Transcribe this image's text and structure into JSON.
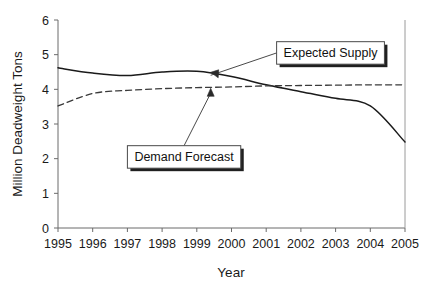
{
  "chart_data": {
    "type": "line",
    "title": "",
    "xlabel": "Year",
    "ylabel": "Million Deadweight Tons",
    "x": [
      1995,
      1996,
      1997,
      1998,
      1999,
      2000,
      2001,
      2002,
      2003,
      2004,
      2005
    ],
    "xtick_labels": [
      "1995",
      "1996",
      "1997",
      "1998",
      "1999",
      "2000",
      "2001",
      "2002",
      "2003",
      "2004",
      "2005"
    ],
    "ytick_labels": [
      "0",
      "1",
      "2",
      "3",
      "4",
      "5",
      "6"
    ],
    "ytick_values": [
      0,
      1,
      2,
      3,
      4,
      5,
      6
    ],
    "xlim": [
      1995,
      2005
    ],
    "ylim": [
      0,
      6
    ],
    "grid": false,
    "legend_position": "annotations",
    "series": [
      {
        "name": "Expected Supply",
        "style": "solid",
        "color": "#1a1a1a",
        "values": [
          4.62,
          4.47,
          4.4,
          4.5,
          4.52,
          4.37,
          4.13,
          3.93,
          3.74,
          3.52,
          2.48
        ]
      },
      {
        "name": "Demand Forecast",
        "style": "dashed",
        "color": "#3a3a3a",
        "values": [
          3.52,
          3.88,
          3.97,
          4.02,
          4.05,
          4.07,
          4.1,
          4.11,
          4.12,
          4.13,
          4.13
        ]
      }
    ],
    "annotations": [
      {
        "label": "Expected Supply",
        "target_x": 1999.4,
        "target_y": 4.52,
        "box_x": 2001.3,
        "box_y": 5.05
      },
      {
        "label": "Demand Forecast",
        "target_x": 1999.4,
        "target_y": 4.06,
        "box_x": 1997.0,
        "box_y": 2.05
      }
    ]
  },
  "axis": {
    "x_title": "Year",
    "y_title": "Million Deadweight Tons"
  }
}
